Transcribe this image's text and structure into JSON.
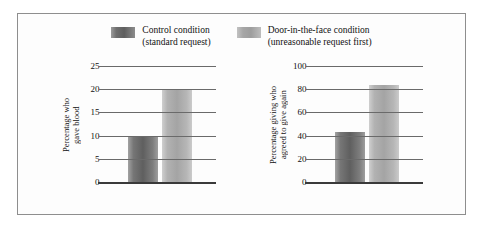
{
  "figure": {
    "legend": {
      "entries": [
        {
          "swatch": "dark-gray-swatch",
          "line1": "Control condition",
          "line2": "(standard request)",
          "color": "#5f5f5f"
        },
        {
          "swatch": "light-gray-swatch",
          "line1": "Door-in-the-face condition",
          "line2": "(unreasonable request first)",
          "color": "#a4a4a4"
        }
      ]
    }
  },
  "chart_data": [
    {
      "type": "bar",
      "title": "",
      "xlabel": "",
      "ylabel": "Percentage who\ngave blood",
      "categories": [
        "Control condition (standard request)",
        "Door-in-the-face condition (unreasonable request first)"
      ],
      "values": [
        10,
        20
      ],
      "ylim": [
        0,
        25
      ],
      "yticks": [
        25,
        20,
        15,
        10,
        5,
        0
      ],
      "ytick_labels": [
        "25",
        "20",
        "15",
        "10",
        "5",
        "0"
      ],
      "grid": true,
      "legend_position": "top-center",
      "series": [
        {
          "name": "Control condition",
          "values": [
            10
          ]
        },
        {
          "name": "Door-in-the-face condition",
          "values": [
            20
          ]
        }
      ]
    },
    {
      "type": "bar",
      "title": "",
      "xlabel": "",
      "ylabel": "Percentage giving who\nagreed to give again",
      "categories": [
        "Control condition (standard request)",
        "Door-in-the-face condition (unreasonable request first)"
      ],
      "values": [
        43,
        84
      ],
      "ylim": [
        0,
        100
      ],
      "yticks": [
        100,
        80,
        60,
        40,
        20,
        0
      ],
      "ytick_labels": [
        "100",
        "80",
        "60",
        "40",
        "20",
        "0"
      ],
      "grid": true,
      "legend_position": "top-center",
      "series": [
        {
          "name": "Control condition",
          "values": [
            43
          ]
        },
        {
          "name": "Door-in-the-face condition",
          "values": [
            84
          ]
        }
      ]
    }
  ]
}
